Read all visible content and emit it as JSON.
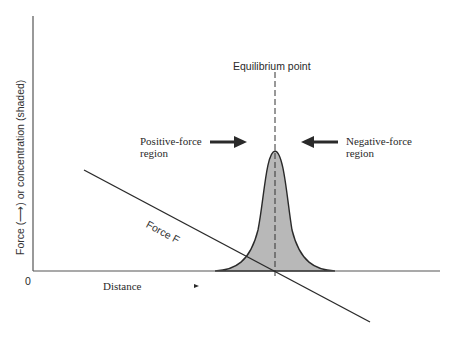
{
  "diagram": {
    "y_axis_label": "Force (⟶) or concentration (shaded)",
    "x_axis_label": "Distance",
    "origin_label": "0",
    "equilibrium_label": "Equilibrium point",
    "positive_region_label_line1": "Positive-force",
    "positive_region_label_line2": "region",
    "negative_region_label_line1": "Negative-force",
    "negative_region_label_line2": "region",
    "force_line_label": "Force F",
    "colors": {
      "ink": "#2a2a2a",
      "shaded": "#b8b8b8",
      "distance_arrow_start": "#3a6b5a",
      "distance_arrow_end": "#d04040"
    }
  }
}
